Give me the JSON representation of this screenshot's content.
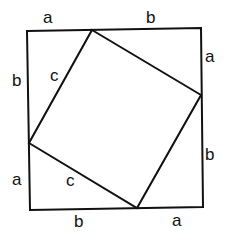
{
  "diagram": {
    "colors": {
      "stroke": "#111111",
      "background": "#ffffff"
    },
    "outer_square": {
      "points": [
        [
          27,
          31
        ],
        [
          201,
          28
        ],
        [
          203,
          207
        ],
        [
          30,
          210
        ]
      ]
    },
    "inner_square": {
      "points": [
        [
          92,
          30
        ],
        [
          201,
          95
        ],
        [
          137,
          208
        ],
        [
          29,
          143
        ]
      ]
    },
    "labels": {
      "top_a": "a",
      "top_b": "b",
      "right_a": "a",
      "right_b": "b",
      "bottom_b": "b",
      "bottom_a": "a",
      "left_b": "b",
      "left_a": "a",
      "upper_c": "c",
      "lower_c": "c"
    }
  }
}
